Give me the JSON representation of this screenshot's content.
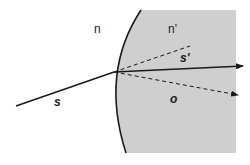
{
  "diagram": {
    "type": "refraction at curved surface",
    "colors": {
      "medium2_fill": "#cfcfcf",
      "line": "#1a1a1a",
      "background": "#ffffff"
    },
    "labels": {
      "n": "n",
      "n_prime": "n'",
      "s": "s",
      "s_prime": "s'",
      "o": "o"
    },
    "elements": {
      "incident_ray": {
        "from": [
          16,
          106
        ],
        "to": [
          114,
          72
        ],
        "style": "solid"
      },
      "refracted_ray": {
        "from": [
          114,
          72
        ],
        "to": [
          243,
          66
        ],
        "style": "solid",
        "arrow": true
      },
      "extended_incident": {
        "from": [
          114,
          72
        ],
        "to": [
          190,
          46
        ],
        "style": "dashed"
      },
      "o_ray": {
        "from": [
          114,
          72
        ],
        "to": [
          238,
          95
        ],
        "style": "dashed",
        "arrow": true
      },
      "interface_curve": {
        "top": [
          141,
          10
        ],
        "vertex": [
          113,
          72
        ],
        "bottom": [
          126,
          153
        ]
      }
    }
  }
}
